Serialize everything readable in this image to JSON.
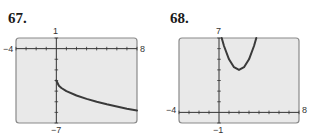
{
  "chart_data": [
    {
      "type": "line",
      "exercise_number": "67.",
      "title": "",
      "xlabel": "",
      "ylabel": "",
      "xlim": [
        -4,
        8
      ],
      "ylim": [
        -7,
        1
      ],
      "window_labels": {
        "xmin": "−4",
        "xmax": "8",
        "ymin": "−7",
        "ymax": "1"
      },
      "grid": false,
      "tick_step": 1,
      "background": "#e9e9e9",
      "curve_color": "#3a3a3a",
      "series": [
        {
          "name": "curve",
          "x": [
            0,
            0.25,
            0.5,
            1,
            2,
            3,
            4,
            5,
            6,
            7,
            8
          ],
          "y": [
            -3,
            -3.5,
            -3.71,
            -4,
            -4.41,
            -4.73,
            -5,
            -5.24,
            -5.45,
            -5.65,
            -5.83
          ]
        }
      ]
    },
    {
      "type": "line",
      "exercise_number": "68.",
      "title": "",
      "xlabel": "",
      "ylabel": "",
      "xlim": [
        -4,
        8
      ],
      "ylim": [
        -1,
        7
      ],
      "window_labels": {
        "xmin": "−4",
        "xmax": "8",
        "ymin": "−1",
        "ymax": "7"
      },
      "grid": false,
      "tick_step": 1,
      "background": "#e9e9e9",
      "curve_color": "#3a3a3a",
      "series": [
        {
          "name": "curve",
          "x": [
            0.27,
            0.5,
            1,
            1.5,
            2,
            2.5,
            3,
            3.5,
            3.73
          ],
          "y": [
            7,
            6.25,
            5,
            4.25,
            4,
            4.25,
            5,
            6.25,
            7
          ]
        }
      ]
    }
  ]
}
